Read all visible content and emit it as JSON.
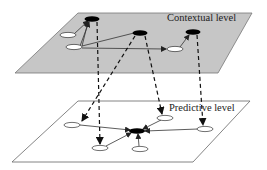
{
  "diagram": {
    "type": "two-level network",
    "levels": [
      {
        "id": "contextual",
        "label": "Contextual level",
        "fill": "#c8c8c8",
        "stroke": "#666666"
      },
      {
        "id": "predictive",
        "label": "Predictive level",
        "fill": "#ffffff",
        "stroke": "#666666"
      }
    ],
    "colors": {
      "black_node": "#000000",
      "white_node": "#ffffff",
      "edge": "#333333",
      "dashed": "#111111"
    },
    "contextual_nodes": [
      {
        "id": "A",
        "type": "black"
      },
      {
        "id": "B",
        "type": "white"
      },
      {
        "id": "C",
        "type": "white"
      },
      {
        "id": "D",
        "type": "black"
      },
      {
        "id": "E",
        "type": "black"
      },
      {
        "id": "F",
        "type": "white"
      }
    ],
    "contextual_edges": [
      {
        "from": "B",
        "to": "A"
      },
      {
        "from": "C",
        "to": "A"
      },
      {
        "from": "D",
        "to": "C"
      },
      {
        "from": "C",
        "to": "F"
      },
      {
        "from": "F",
        "to": "E"
      }
    ],
    "predictive_nodes": [
      {
        "id": "hub",
        "type": "black"
      },
      {
        "id": "p1",
        "type": "white"
      },
      {
        "id": "p2",
        "type": "white"
      },
      {
        "id": "p3",
        "type": "white"
      },
      {
        "id": "p4",
        "type": "white"
      },
      {
        "id": "p5",
        "type": "white"
      }
    ],
    "predictive_edges": [
      {
        "from": "p1",
        "to": "hub"
      },
      {
        "from": "p2",
        "to": "hub"
      },
      {
        "from": "p3",
        "to": "hub"
      },
      {
        "from": "p4",
        "to": "hub"
      },
      {
        "from": "p5",
        "to": "hub"
      }
    ],
    "cross_level_edges": [
      {
        "from": "A",
        "to": "p2",
        "style": "dashed"
      },
      {
        "from": "D",
        "to": "p1",
        "style": "dashed"
      },
      {
        "from": "D",
        "to": "p3",
        "style": "dashed"
      },
      {
        "from": "E",
        "to": "p4",
        "style": "dashed"
      }
    ]
  }
}
